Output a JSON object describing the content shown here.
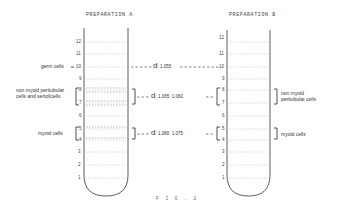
{
  "preparation_a": {
    "title": "PREPARATION A",
    "scale": [
      "1",
      "2",
      "3",
      "4",
      "5",
      "6",
      "7",
      "8",
      "9",
      "10",
      "11",
      "12"
    ],
    "labels": {
      "germ": "germ cells",
      "nonmyoid_line1": "non myoid peritubular",
      "nonmyoid_line2": "cells and sertolicells",
      "myoid": "myoid cells"
    }
  },
  "preparation_b": {
    "title": "PREPARATION B",
    "scale": [
      "1",
      "2",
      "3",
      "4",
      "5",
      "6",
      "7",
      "8",
      "9",
      "10",
      "11",
      "12"
    ],
    "labels": {
      "nonmyoid_line1": "non myoid",
      "nonmyoid_line2": "peritubular cells",
      "myoid": "myoid cells"
    }
  },
  "densities": {
    "germ": {
      "prefix": "d",
      "a": "1.055"
    },
    "nonmyoid": {
      "prefix": "d",
      "a": "1.065",
      "b": "1.060"
    },
    "myoid": {
      "prefix": "d",
      "a": "1.080",
      "b": "1.075"
    }
  },
  "caption": "F I G .  2"
}
